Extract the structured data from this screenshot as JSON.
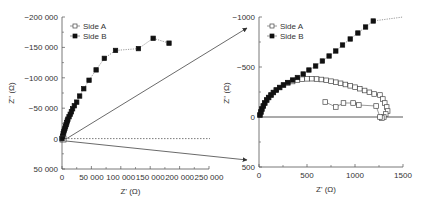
{
  "chart_data": [
    {
      "type": "scatter",
      "title": "",
      "xlabel": "Z' (Ω)",
      "ylabel": "Z'' (Ω)",
      "xlim": [
        0,
        250000
      ],
      "ylim": [
        50000,
        -200000
      ],
      "y_inverted": true,
      "x_ticks": [
        "0",
        "50 000",
        "100 000",
        "150 000",
        "200 000",
        "250 000"
      ],
      "y_ticks": [
        "-200 000",
        "-150 000",
        "-100 000",
        "-50 000",
        "0",
        "50 000"
      ],
      "legend_position": "top-left",
      "series": [
        {
          "name": "Side A",
          "marker": "open-square",
          "x": [
            0,
            500,
            1000,
            1300
          ],
          "y": [
            0,
            -300,
            -350,
            0
          ]
        },
        {
          "name": "Side B",
          "marker": "filled-square",
          "line": "dotted",
          "x": [
            0,
            1000,
            2000,
            3000,
            4000,
            5000,
            6000,
            7000,
            8000,
            9000,
            10000,
            12000,
            14000,
            16000,
            18000,
            21000,
            25000,
            30000,
            37000,
            46000,
            58000,
            72000,
            91000,
            130000,
            155000,
            182000
          ],
          "y": [
            0,
            -4000,
            -8000,
            -11000,
            -14000,
            -17000,
            -20000,
            -23000,
            -26000,
            -29000,
            -32000,
            -36000,
            -40000,
            -44000,
            -49000,
            -54000,
            -60000,
            -70000,
            -82000,
            -96000,
            -113000,
            -132000,
            -145000,
            -148000,
            -165000,
            -157000
          ]
        }
      ],
      "annotations": [
        "dotted horizontal line at Z''=0",
        "zoom box at origin with arrows to right panel"
      ]
    },
    {
      "type": "scatter",
      "title": "",
      "xlabel": "Z' (Ω)",
      "ylabel": "Z'' (Ω)",
      "xlim": [
        0,
        1500
      ],
      "ylim": [
        500,
        -1000
      ],
      "y_inverted": true,
      "x_ticks": [
        "0",
        "500",
        "1000",
        "1500"
      ],
      "y_ticks": [
        "-1000",
        "-500",
        "0",
        "500"
      ],
      "legend_position": "top-left",
      "series": [
        {
          "name": "Side A",
          "marker": "open-square",
          "line": "solid",
          "x": [
            10,
            20,
            30,
            45,
            60,
            80,
            100,
            125,
            150,
            180,
            215,
            255,
            300,
            350,
            400,
            450,
            500,
            550,
            600,
            650,
            700,
            750,
            800,
            850,
            900,
            950,
            1000,
            1050,
            1100,
            1150,
            1200,
            1260,
            1290,
            1310,
            1330,
            1340,
            1320,
            1300,
            1280,
            1260,
            1220,
            1040,
            980,
            880,
            800,
            690
          ],
          "y": [
            -20,
            -50,
            -80,
            -110,
            -140,
            -170,
            -195,
            -220,
            -245,
            -270,
            -295,
            -320,
            -340,
            -355,
            -370,
            -378,
            -382,
            -383,
            -380,
            -375,
            -367,
            -358,
            -348,
            -337,
            -325,
            -312,
            -298,
            -283,
            -265,
            -247,
            -230,
            -220,
            -180,
            -140,
            -100,
            -60,
            -30,
            0,
            10,
            0,
            -110,
            -120,
            -140,
            -140,
            -100,
            -150
          ]
        },
        {
          "name": "Side B",
          "marker": "filled-square",
          "line": "dotted",
          "x": [
            10,
            20,
            30,
            45,
            60,
            80,
            100,
            125,
            150,
            180,
            215,
            255,
            300,
            350,
            400,
            460,
            520,
            590,
            660,
            730,
            800,
            870,
            950,
            1030,
            1110,
            1190,
            1500
          ],
          "y": [
            -20,
            -50,
            -80,
            -110,
            -140,
            -170,
            -195,
            -220,
            -245,
            -270,
            -295,
            -320,
            -345,
            -370,
            -395,
            -430,
            -470,
            -510,
            -560,
            -610,
            -660,
            -720,
            -780,
            -840,
            -900,
            -960,
            -1000
          ]
        }
      ],
      "annotations": [
        "solid horizontal line at Z''=0"
      ]
    }
  ]
}
